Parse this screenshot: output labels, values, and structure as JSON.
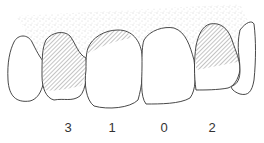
{
  "diagram": {
    "teeth": [
      {
        "score": "3",
        "x": 68,
        "shading": "heavy"
      },
      {
        "score": "1",
        "x": 112,
        "shading": "top"
      },
      {
        "score": "0",
        "x": 164,
        "shading": "none"
      },
      {
        "score": "2",
        "x": 212,
        "shading": "partial"
      }
    ],
    "colors": {
      "outline": "#333333",
      "hatch": "#555555",
      "stipple": "#888888"
    }
  }
}
